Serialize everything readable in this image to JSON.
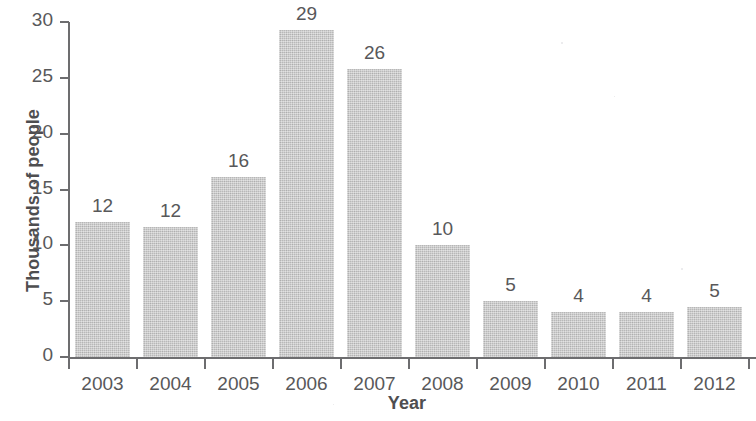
{
  "chart_data": {
    "type": "bar",
    "title": "",
    "xlabel": "Year",
    "ylabel": "Thousands of people",
    "categories": [
      "2003",
      "2004",
      "2005",
      "2006",
      "2007",
      "2008",
      "2009",
      "2010",
      "2011",
      "2012"
    ],
    "values": [
      12,
      12,
      16,
      29,
      26,
      10,
      5,
      4,
      4,
      5
    ],
    "bar_heights_measured": [
      12.1,
      11.6,
      16.1,
      29.3,
      25.8,
      10.0,
      5.0,
      4.0,
      4.0,
      4.5
    ],
    "data_labels": [
      "12",
      "12",
      "16",
      "29",
      "26",
      "10",
      "5",
      "4",
      "4",
      "5"
    ],
    "ylim": [
      0,
      30
    ],
    "ytick_labels": [
      "0",
      "5",
      "10",
      "15",
      "20",
      "25",
      "30"
    ],
    "ytick_values": [
      0,
      5,
      10,
      15,
      20,
      25,
      30
    ],
    "grid": false,
    "legend": false,
    "bar_color": "#c6c6c6",
    "axis_color": "#6d6d6f",
    "text_color": "#58585a"
  },
  "axes": {
    "y_title": "Thousands of people",
    "x_title": "Year"
  }
}
